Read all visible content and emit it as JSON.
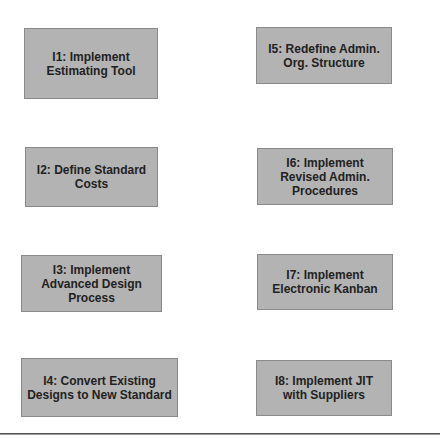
{
  "diagram": {
    "initiatives": [
      {
        "id": "I1",
        "label": "I1: Implement\nEstimating Tool"
      },
      {
        "id": "I2",
        "label": "I2: Define Standard\nCosts"
      },
      {
        "id": "I3",
        "label": "I3: Implement\nAdvanced Design\nProcess"
      },
      {
        "id": "I4",
        "label": "I4: Convert Existing\nDesigns to New Standard"
      },
      {
        "id": "I5",
        "label": "I5: Redefine Admin.\nOrg. Structure"
      },
      {
        "id": "I6",
        "label": "I6: Implement\nRevised Admin.\nProcedures"
      },
      {
        "id": "I7",
        "label": "I7: Implement\nElectronic Kanban"
      },
      {
        "id": "I8",
        "label": "I8: Implement JIT\nwith Suppliers"
      }
    ],
    "colors": {
      "box_fill": "#b3b3b3",
      "box_border": "#8a8a8a",
      "text": "#222222",
      "divider": "#555555"
    }
  }
}
